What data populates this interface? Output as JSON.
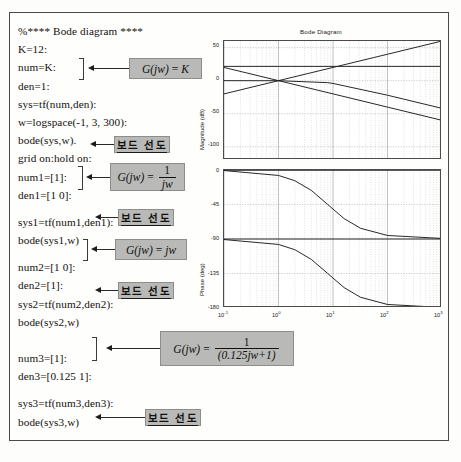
{
  "document": {
    "kind": "matlab-bode-listing-scan"
  },
  "code": {
    "lines": [
      {
        "text": "%**** Bode diagram ****",
        "type": "comment"
      },
      {
        "text": "K=12:",
        "type": "stmt"
      },
      {
        "text": "num=K:",
        "type": "stmt"
      },
      {
        "text": "den=1:",
        "type": "stmt"
      },
      {
        "text": "sys=tf(num,den):",
        "type": "stmt"
      },
      {
        "text": "w=logspace(-1, 3, 300):",
        "type": "stmt"
      },
      {
        "text": "bode(sys,w).",
        "type": "stmt"
      },
      {
        "text": "grid on:hold on:",
        "type": "stmt"
      },
      {
        "text": "num1=[1]:",
        "type": "stmt"
      },
      {
        "text": "den1=[1 0]:",
        "type": "stmt"
      },
      {
        "text": "sys1=tf(num1,den1):",
        "type": "stmt"
      },
      {
        "text": "bode(sys1,w)",
        "type": "stmt"
      },
      {
        "text": "num2=[1 0]:",
        "type": "stmt"
      },
      {
        "text": "den2=[1]:",
        "type": "stmt"
      },
      {
        "text": "sys2=tf(num2,den2):",
        "type": "stmt"
      },
      {
        "text": "bode(sys2,w)",
        "type": "stmt"
      },
      {
        "text": "num3=[1]:",
        "type": "stmt"
      },
      {
        "text": "den3=[0.125  1]:",
        "type": "stmt"
      },
      {
        "text": "sys3=tf(num3,den3):",
        "type": "stmt"
      },
      {
        "text": "bode(sys3,w)",
        "type": "stmt"
      }
    ]
  },
  "annotations": {
    "bode_label": "보드 선도",
    "formula_k": {
      "lhs": "G(jw)",
      "eq": "=",
      "rhs": "K"
    },
    "formula_inv_jw": {
      "lhs": "G(jw)",
      "eq": "=",
      "num": "1",
      "den": "jw"
    },
    "formula_jw": {
      "lhs": "G(jw)",
      "eq": "=",
      "rhs": "jw"
    },
    "formula_lag": {
      "lhs": "G(jw)",
      "eq": "=",
      "num": "1",
      "den": "(0.125jw+1)"
    }
  },
  "chart_data": {
    "type": "line",
    "title": "Bode Diagram",
    "xlabel": "",
    "xscale": "log",
    "xlim": [
      0.1,
      1000
    ],
    "xticks": [
      0.1,
      1,
      10,
      100,
      1000
    ],
    "xticklabels": [
      "10-1",
      "100",
      "101",
      "102",
      "103"
    ],
    "xtick_exponents": [
      "-1",
      "0",
      "1",
      "2",
      "3"
    ],
    "grid": true,
    "legend": "none",
    "subplots": [
      {
        "name": "magnitude",
        "ylabel": "Magnitude (dB)",
        "ylim": [
          -120,
          60
        ],
        "yticks": [
          50,
          0,
          -50,
          -100
        ],
        "yticklabels": [
          "50",
          "0",
          "-50",
          "-100"
        ],
        "series": [
          {
            "name": "G(jw) = K  (K = 12)",
            "x": [
              0.1,
              1,
              10,
              100,
              1000
            ],
            "y": [
              21.6,
              21.6,
              21.6,
              21.6,
              21.6
            ]
          },
          {
            "name": "G(jw) = 1/(jw)",
            "x": [
              0.1,
              1,
              10,
              100,
              1000
            ],
            "y": [
              20,
              0,
              -20,
              -40,
              -60
            ]
          },
          {
            "name": "G(jw) = jw",
            "x": [
              0.1,
              1,
              10,
              100,
              1000
            ],
            "y": [
              -20,
              0,
              20,
              40,
              60
            ]
          },
          {
            "name": "G(jw) = 1/(0.125jw+1)",
            "x": [
              0.1,
              1,
              8,
              10,
              100,
              1000
            ],
            "y": [
              0,
              -0.07,
              -3,
              -4.2,
              -22,
              -41.9
            ]
          }
        ]
      },
      {
        "name": "phase",
        "ylabel": "Phase (deg)",
        "ylim": [
          -180,
          0
        ],
        "yticks": [
          0,
          -45,
          -90,
          -135,
          -180
        ],
        "yticklabels": [
          "0",
          "-45",
          "-90",
          "-135",
          "-180"
        ],
        "series": [
          {
            "name": "G(jw) = K",
            "x": [
              0.1,
              1000
            ],
            "y": [
              0,
              0
            ]
          },
          {
            "name": "G(jw) = jw",
            "x": [
              0.1,
              1000
            ],
            "y": [
              0,
              0
            ]
          },
          {
            "name": "G(jw) = 1/(jw)",
            "x": [
              0.1,
              1000
            ],
            "y": [
              -90,
              -90
            ]
          },
          {
            "name": "G(jw) = 1/(0.125jw+1)",
            "x": [
              0.1,
              1,
              2,
              4,
              8,
              16,
              32,
              100,
              1000
            ],
            "y": [
              -0.7,
              -7.1,
              -14,
              -26.6,
              -45,
              -63.4,
              -76,
              -85.4,
              -89.3
            ]
          },
          {
            "name": "G(jw) = 1/(jw) + lag",
            "x": [
              0.1,
              1,
              2,
              4,
              8,
              16,
              32,
              100,
              1000
            ],
            "y": [
              -90.7,
              -97.1,
              -104,
              -116.6,
              -135,
              -153.4,
              -166,
              -175.4,
              -179.3
            ]
          }
        ]
      }
    ]
  }
}
